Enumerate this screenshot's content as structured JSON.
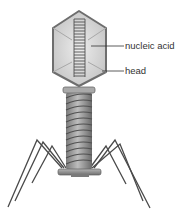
{
  "diagram": {
    "labels": [
      {
        "id": "nucleic-acid",
        "text": "nucleic acid",
        "x": 125,
        "y": 49,
        "line_from": [
          91,
          46
        ],
        "line_to": [
          124,
          46
        ]
      },
      {
        "id": "head",
        "text": "head",
        "x": 125,
        "y": 74,
        "line_from": [
          102,
          71
        ],
        "line_to": [
          124,
          71
        ]
      }
    ],
    "colors": {
      "head_fill": "#cfcfcf",
      "head_light": "#e6e6e6",
      "head_stroke": "#6e6e6e",
      "tail_fill": "#9a9a9a",
      "tail_dark": "#5e5e5e",
      "leg_stroke": "#4a4a4a",
      "text": "#333333"
    }
  }
}
